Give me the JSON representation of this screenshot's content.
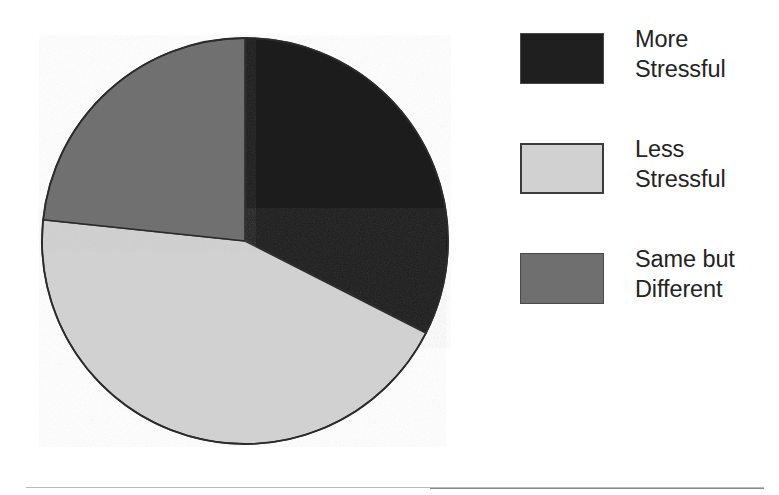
{
  "chart_data": {
    "type": "pie",
    "title": "",
    "subtitle": "",
    "xlabel": "",
    "ylabel": "",
    "grid": false,
    "legend_position": "right",
    "start_angle_deg": 0,
    "direction": "clockwise",
    "categories": [
      "More Stressful",
      "Less Stressful",
      "Same but Different"
    ],
    "values": [
      32.5,
      44.0,
      23.5
    ],
    "value_unit": "percent",
    "sweep_angles_deg": [
      117,
      159,
      84
    ],
    "colors": [
      "#1f1f1f",
      "#d1d1d1",
      "#6f6f6f"
    ],
    "slices": [
      {
        "label": "More Stressful",
        "value": 32.5,
        "sweep_deg": 117,
        "start_deg": 0,
        "end_deg": 117,
        "color": "#1f1f1f"
      },
      {
        "label": "Less Stressful",
        "value": 44.0,
        "sweep_deg": 159,
        "start_deg": 117,
        "end_deg": 276,
        "color": "#d1d1d1"
      },
      {
        "label": "Same but Different",
        "value": 23.5,
        "sweep_deg": 84,
        "start_deg": 276,
        "end_deg": 360,
        "color": "#6f6f6f"
      }
    ],
    "annotations": []
  },
  "legend": {
    "items": [
      {
        "label": "More\nStressful",
        "color": "#1f1f1f",
        "swatch_name": "legend-swatch-more-stressful"
      },
      {
        "label": "Less\nStressful",
        "color": "#d1d1d1",
        "swatch_name": "legend-swatch-less-stressful"
      },
      {
        "label": "Same but\nDifferent",
        "color": "#6f6f6f",
        "swatch_name": "legend-swatch-same-but-different"
      }
    ]
  },
  "style": {
    "background": "#ffffff",
    "outline": "#2b2b2b",
    "text": "#232323"
  }
}
